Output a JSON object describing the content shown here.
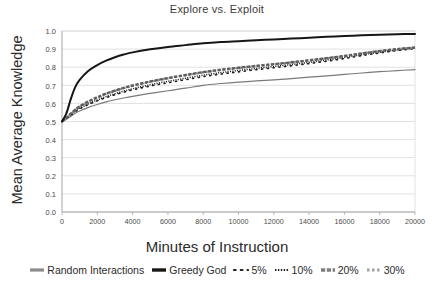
{
  "chart_data": {
    "type": "line",
    "title": "Explore vs. Exploit",
    "xlabel": "Minutes of Instruction",
    "ylabel": "Mean Average Knowledge",
    "xlim": [
      0,
      20000
    ],
    "ylim": [
      0.0,
      1.0
    ],
    "grid": "horizontal",
    "legend_position": "bottom",
    "xticks": [
      0,
      2000,
      4000,
      6000,
      8000,
      10000,
      12000,
      14000,
      16000,
      18000,
      20000
    ],
    "xticklabels": [
      "0",
      "2000",
      "4000",
      "6000",
      "8000",
      "10000",
      "12000",
      "14000",
      "16000",
      "18000",
      "20000"
    ],
    "yticks": [
      0.0,
      0.1,
      0.2,
      0.3,
      0.4,
      0.5,
      0.6,
      0.7,
      0.8,
      0.9,
      1.0
    ],
    "yticklabels": [
      "0.0",
      "0.1",
      "0.2",
      "0.3",
      "0.4",
      "0.5",
      "0.6",
      "0.7",
      "0.8",
      "0.9",
      "1.0"
    ],
    "x": [
      0,
      250,
      500,
      750,
      1000,
      1500,
      2000,
      2500,
      3000,
      3500,
      4000,
      5000,
      6000,
      7000,
      8000,
      9000,
      10000,
      11000,
      12000,
      13000,
      14000,
      15000,
      16000,
      17000,
      18000,
      19000,
      20000
    ],
    "series": [
      {
        "name": "Random Interactions",
        "color": "#7a7a7a",
        "style": "solid",
        "width": 1.2,
        "values": [
          0.5,
          0.512,
          0.528,
          0.545,
          0.558,
          0.578,
          0.594,
          0.608,
          0.62,
          0.63,
          0.639,
          0.655,
          0.67,
          0.684,
          0.7,
          0.71,
          0.718,
          0.724,
          0.73,
          0.737,
          0.745,
          0.752,
          0.76,
          0.768,
          0.775,
          0.781,
          0.787
        ]
      },
      {
        "name": "Greedy God",
        "color": "#161616",
        "style": "solid",
        "width": 2.0,
        "values": [
          0.5,
          0.545,
          0.625,
          0.69,
          0.73,
          0.78,
          0.812,
          0.836,
          0.855,
          0.87,
          0.882,
          0.899,
          0.912,
          0.922,
          0.932,
          0.939,
          0.944,
          0.949,
          0.953,
          0.958,
          0.963,
          0.968,
          0.972,
          0.976,
          0.979,
          0.982,
          0.984
        ]
      },
      {
        "name": "5%",
        "color": "#1f1f1f",
        "style": "sparse-dot",
        "width": 1.6,
        "values": [
          0.5,
          0.516,
          0.535,
          0.554,
          0.57,
          0.594,
          0.614,
          0.632,
          0.648,
          0.662,
          0.675,
          0.696,
          0.714,
          0.731,
          0.748,
          0.762,
          0.774,
          0.786,
          0.797,
          0.808,
          0.82,
          0.833,
          0.848,
          0.864,
          0.879,
          0.892,
          0.903
        ]
      },
      {
        "name": "10%",
        "color": "#1f1f1f",
        "style": "fine-dot",
        "width": 1.5,
        "values": [
          0.5,
          0.517,
          0.537,
          0.557,
          0.573,
          0.598,
          0.619,
          0.638,
          0.654,
          0.668,
          0.681,
          0.703,
          0.722,
          0.739,
          0.756,
          0.77,
          0.782,
          0.793,
          0.804,
          0.815,
          0.827,
          0.84,
          0.854,
          0.869,
          0.883,
          0.895,
          0.905
        ]
      },
      {
        "name": "20%",
        "color": "#5e5e5e",
        "style": "thick-dash",
        "width": 2.4,
        "values": [
          0.5,
          0.52,
          0.543,
          0.565,
          0.583,
          0.611,
          0.634,
          0.654,
          0.671,
          0.686,
          0.699,
          0.721,
          0.74,
          0.757,
          0.773,
          0.786,
          0.797,
          0.807,
          0.817,
          0.827,
          0.838,
          0.85,
          0.862,
          0.876,
          0.889,
          0.9,
          0.909
        ]
      },
      {
        "name": "30%",
        "color": "#8c8c8c",
        "style": "dash-dot",
        "width": 2.2,
        "values": [
          0.5,
          0.519,
          0.541,
          0.563,
          0.581,
          0.609,
          0.632,
          0.652,
          0.669,
          0.684,
          0.697,
          0.719,
          0.738,
          0.755,
          0.771,
          0.784,
          0.795,
          0.805,
          0.815,
          0.826,
          0.837,
          0.849,
          0.862,
          0.876,
          0.889,
          0.9,
          0.908
        ]
      }
    ]
  },
  "legend": {
    "items": [
      {
        "label": "Random Interactions"
      },
      {
        "label": "Greedy God"
      },
      {
        "label": "5%"
      },
      {
        "label": "10%"
      },
      {
        "label": "20%"
      },
      {
        "label": "30%"
      }
    ]
  },
  "colors": {
    "axis": "#a6a6a6",
    "grid": "#d9d9d9",
    "tick_text": "#4a4a4a",
    "title_text": "#3b3b3b",
    "label_text": "#2b2b2b",
    "plot_background": "#ffffff"
  }
}
